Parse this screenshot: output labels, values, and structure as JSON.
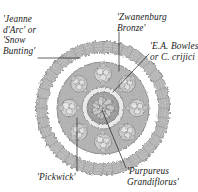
{
  "figure": {
    "background_color": "#ffffff",
    "ink_color": "#2b2b2b",
    "center": {
      "x": 103,
      "y": 108
    },
    "rings": [
      {
        "name": "outer-spiky-ring",
        "outer_radius": 67,
        "inner_radius": 56,
        "fill": "#b9b9b9",
        "description": "spiky textured outer band"
      },
      {
        "name": "white-gap-ring",
        "outer_radius": 56,
        "inner_radius": 46,
        "fill": "#ffffff",
        "description": "bare ring between outer band and cluster ring"
      },
      {
        "name": "cluster-ring",
        "outer_radius": 46,
        "inner_radius": 21,
        "fill": "#aeaeae",
        "description": "ring of clumped flower groups"
      },
      {
        "name": "core-rim",
        "outer_radius": 21,
        "inner_radius": 16,
        "fill": "#e4e4e4",
        "description": "pale rim around centre"
      },
      {
        "name": "core-centre",
        "outer_radius": 16,
        "inner_radius": 0,
        "fill": "#9d9d9d",
        "description": "dense scribbled central cluster"
      }
    ],
    "labels": [
      {
        "id": "jeanne",
        "lines": [
          "'Jeanne",
          "d'Arc' or",
          "'Snow",
          "Bunting'"
        ],
        "points_to": "outer-spiky-ring"
      },
      {
        "id": "zwanenburg",
        "lines": [
          "'Zwanenburg",
          "Bronze'"
        ],
        "points_to": "cluster-ring"
      },
      {
        "id": "bowles",
        "lines": [
          "'E.A. Bowles'",
          "or C. crijici"
        ],
        "points_to": "core-rim"
      },
      {
        "id": "pickwick",
        "lines": [
          "'Pickwick'"
        ],
        "points_to": "cluster-ring"
      },
      {
        "id": "purpureus",
        "lines": [
          "'Purpureus",
          "Grandiflorus'"
        ],
        "points_to": "core-centre"
      }
    ]
  }
}
